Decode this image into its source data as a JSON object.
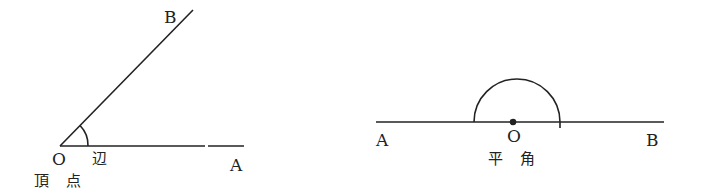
{
  "diagrams": [
    {
      "name": "angle",
      "labels": {
        "B": "B",
        "O": "O",
        "A": "A",
        "side": "辺",
        "vertex": "頂 点"
      }
    },
    {
      "name": "straight-angle",
      "labels": {
        "A": "A",
        "O": "O",
        "B": "B",
        "caption": "平 角"
      }
    }
  ],
  "colors": {
    "stroke": "#222222",
    "background": "#ffffff"
  }
}
